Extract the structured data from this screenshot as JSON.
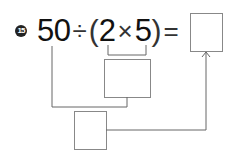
{
  "problem": {
    "number": "15",
    "expression": {
      "left": "50",
      "divide": "÷",
      "open_paren": "(",
      "a": "2",
      "times": "×",
      "b": "5",
      "close_paren": ")",
      "equals": "="
    },
    "answer_box": "",
    "middle_box": "",
    "bottom_box": ""
  }
}
